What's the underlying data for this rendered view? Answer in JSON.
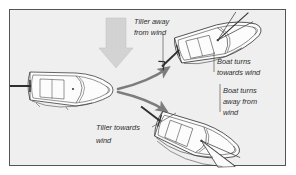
{
  "figure": {
    "type": "illustration",
    "frame": {
      "border_color": "#555555",
      "border_width_px": 1,
      "inset_px": 9,
      "outer_background": "#ffffff"
    },
    "background": {
      "name": "water-texture",
      "description": "mottled gray stippled water surface",
      "base_color": "#e2e2e2",
      "speckle_light": "#f2f2f2",
      "speckle_dark": "#b9b9b9"
    },
    "ink_color": "#3a3a3a",
    "arrow_color": "#7d7d7d",
    "wind_arrow": {
      "name": "wind-direction-arrow",
      "label": "",
      "direction": "down",
      "fill": "#c9c9c9",
      "stroke": "#b0b0b0"
    },
    "boats": [
      {
        "id": "boat-center",
        "name": "sailboat-center",
        "heading_deg": 0,
        "caption": "Boat sailing straight, tiller centered"
      },
      {
        "id": "boat-upper-right",
        "name": "sailboat-turning-towards-wind",
        "heading_deg": -18,
        "caption": "Boat turns towards wind"
      },
      {
        "id": "boat-lower-right",
        "name": "sailboat-turning-away-from-wind",
        "heading_deg": 20,
        "caption": "Boat turns away from wind"
      }
    ],
    "turn_arrows": [
      {
        "name": "turn-arrow-towards-wind",
        "from": "boat-center",
        "to": "boat-upper-right"
      },
      {
        "name": "turn-arrow-away-from-wind",
        "from": "boat-center",
        "to": "boat-lower-right"
      }
    ],
    "labels": {
      "tiller_away": {
        "name": "label-tiller-away-from-wind",
        "lines": [
          "Tiller away",
          "from wind"
        ],
        "x": 134,
        "y": 18,
        "align": "left",
        "leader": true
      },
      "boat_towards": {
        "name": "label-boat-turns-towards-wind",
        "lines": [
          "Boat turns",
          "towards wind"
        ],
        "x": 216,
        "y": 58,
        "align": "left",
        "leader": true
      },
      "boat_away": {
        "name": "label-boat-turns-away-from-wind",
        "lines": [
          "Boat turns",
          "away from",
          "wind"
        ],
        "x": 222,
        "y": 88,
        "align": "left",
        "leader": true
      },
      "tiller_towards": {
        "name": "label-tiller-towards-wind",
        "lines": [
          "Tiller towards",
          "wind"
        ],
        "x": 95,
        "y": 124,
        "align": "left",
        "leader": true
      }
    }
  }
}
